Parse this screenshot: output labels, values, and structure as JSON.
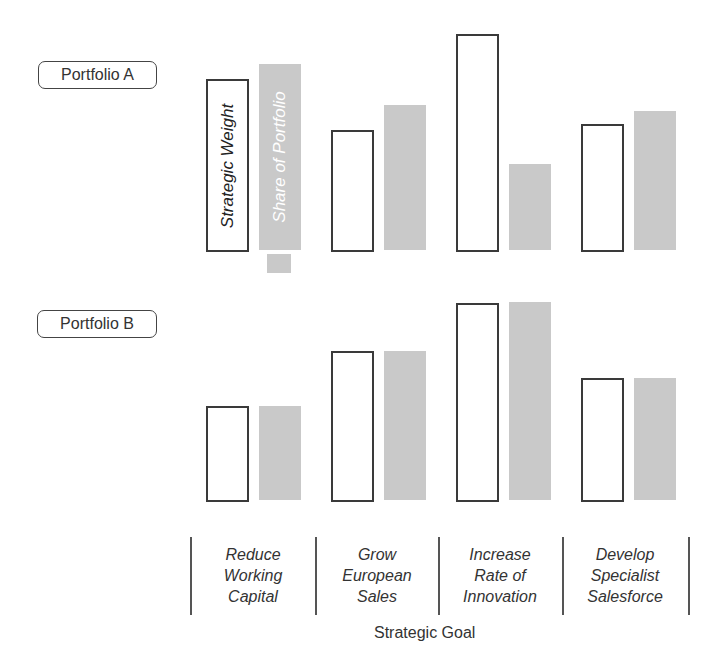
{
  "chart_data": {
    "type": "bar",
    "title": "",
    "xlabel": "Strategic Goal",
    "ylabel": "",
    "grid": false,
    "legend": {
      "position": "inline (rotated text inside first bars of Portfolio A)",
      "entries": [
        "Strategic Weight",
        "Share of Portfolio"
      ]
    },
    "categories": [
      "Reduce Working Capital",
      "Grow European Sales",
      "Increase Rate of Innovation",
      "Develop Specialist Salesforce"
    ],
    "category_lines": [
      [
        "Reduce",
        "Working",
        "Capital"
      ],
      [
        "Grow",
        "European",
        "Sales"
      ],
      [
        "Increase",
        "Rate of",
        "Innovation"
      ],
      [
        "Develop",
        "Specialist",
        "Salesforce"
      ]
    ],
    "units_note": "relative bar heights (no numeric axis shown)",
    "panels": [
      {
        "name": "Portfolio A",
        "series": [
          {
            "name": "Strategic Weight",
            "values": [
              173,
              122,
              218,
              128
            ]
          },
          {
            "name": "Share of Portfolio",
            "values": [
              186,
              145,
              86,
              139
            ]
          }
        ]
      },
      {
        "name": "Portfolio B",
        "series": [
          {
            "name": "Strategic Weight",
            "values": [
              96,
              151,
              199,
              124
            ]
          },
          {
            "name": "Share of Portfolio",
            "values": [
              94,
              149,
              198,
              122
            ]
          }
        ]
      }
    ]
  },
  "labels": {
    "portfolio_a": "Portfolio A",
    "portfolio_b": "Portfolio B",
    "legend_strategic_weight": "Strategic Weight",
    "legend_share_of_portfolio": "Share of Portfolio",
    "x_axis_title": "Strategic Goal",
    "cat0_l1": "Reduce",
    "cat0_l2": "Working",
    "cat0_l3": "Capital",
    "cat1_l1": "Grow",
    "cat1_l2": "European",
    "cat1_l3": "Sales",
    "cat2_l1": "Increase",
    "cat2_l2": "Rate of",
    "cat2_l3": "Innovation",
    "cat3_l1": "Develop",
    "cat3_l2": "Specialist",
    "cat3_l3": "Salesforce"
  },
  "colors": {
    "share_fill": "#c9c9c9",
    "weight_border": "#3a3a3a"
  }
}
